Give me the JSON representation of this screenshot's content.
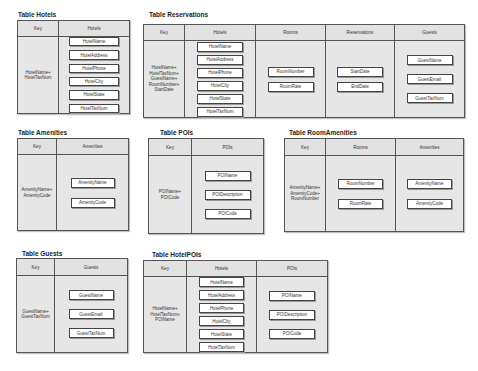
{
  "tables": {
    "hotels": {
      "title": "Table Hotels",
      "key_header": "Key",
      "key": "HotelName+\nHotelTaxNum",
      "columns": [
        {
          "header": "Hotels",
          "fields": [
            "HotelName",
            "HotelAddress",
            "HotelPhone",
            "HotelCity",
            "HotelState",
            "HotelTaxNum"
          ]
        }
      ]
    },
    "reservations": {
      "title": "Table Reservations",
      "key_header": "Key",
      "key": "HotelName+\nHotelTaxNum+\nGuestName+\nRoomNumber+\nStartDate",
      "columns": [
        {
          "header": "Hotels",
          "fields": [
            "HotelName",
            "HotelAddress",
            "HotelPhone",
            "HotelCity",
            "HotelState",
            "HotelTaxNum"
          ]
        },
        {
          "header": "Rooms",
          "fields": [
            "RoomNumber",
            "RoomRate"
          ]
        },
        {
          "header": "Reservations",
          "fields": [
            "StartDate",
            "EndDate"
          ]
        },
        {
          "header": "Guests",
          "fields": [
            "GuestName",
            "GuestEmail",
            "GuestTaxNum"
          ]
        }
      ]
    },
    "amenities": {
      "title": "Table Amenities",
      "key_header": "Key",
      "key": "AmenityName+\nAmenityCode",
      "columns": [
        {
          "header": "Amenities",
          "fields": [
            "AmenityName",
            "AmenityCode"
          ]
        }
      ]
    },
    "pois": {
      "title": "Table POIs",
      "key_header": "Key",
      "key": "POIName+\nPOICode",
      "columns": [
        {
          "header": "POIs",
          "fields": [
            "POIName",
            "POIDescription",
            "POICode"
          ]
        }
      ]
    },
    "roomamenities": {
      "title": "Table RoomAmenities",
      "key_header": "Key",
      "key": "AmenityName+\nAmenityCode+\nRoomNumber",
      "columns": [
        {
          "header": "Rooms",
          "fields": [
            "RoomNumber",
            "RoomRate"
          ]
        },
        {
          "header": "Amenities",
          "fields": [
            "AmenityName",
            "AmenityCode"
          ]
        }
      ]
    },
    "guests": {
      "title": "Table Guests",
      "key_header": "Key",
      "key": "GuestName+\nGuestTaxNum",
      "columns": [
        {
          "header": "Guests",
          "fields": [
            "GuestName",
            "GuestEmail",
            "GuestTaxNum"
          ]
        }
      ]
    },
    "hotelpois": {
      "title": "Table HotelPOIs",
      "key_header": "Key",
      "key": "HotelName+\nHotelTaxNum+\nPOIName",
      "columns": [
        {
          "header": "Hotels",
          "fields": [
            "HotelName",
            "HotelAddress",
            "HotelPhone",
            "HotelCity",
            "HotelState",
            "HotelTaxNum"
          ]
        },
        {
          "header": "POIs",
          "fields": [
            "POIName",
            "POIDescription",
            "POICode"
          ]
        }
      ]
    }
  },
  "colors": {
    "table_bg": "#e6e6e6",
    "border": "#555555",
    "field_bg": "#ffffff"
  }
}
